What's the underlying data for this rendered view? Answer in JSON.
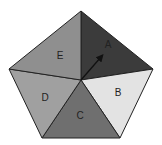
{
  "diagram": {
    "shape": "pentagon spinner",
    "sections": [
      {
        "label": "A",
        "color": "#3b3b3b"
      },
      {
        "label": "B",
        "color": "#e3e3e3"
      },
      {
        "label": "C",
        "color": "#6f6f6f"
      },
      {
        "label": "D",
        "color": "#a0a0a0"
      },
      {
        "label": "E",
        "color": "#8f8f8f"
      }
    ],
    "arrow": {
      "points_to": "A"
    }
  }
}
